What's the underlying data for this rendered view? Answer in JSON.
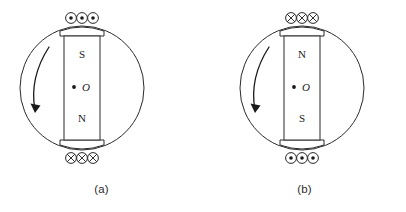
{
  "figure": {
    "panels": [
      {
        "id": "a",
        "caption": "(a)",
        "magnet": {
          "top_pole": "S",
          "bottom_pole": "N",
          "center_label": "O"
        },
        "top_wires": {
          "symbol": "dot",
          "symbol_meaning": "current out of page",
          "count": 3
        },
        "bottom_wires": {
          "symbol": "cross",
          "symbol_meaning": "current into page",
          "count": 3
        },
        "rotation": {
          "direction": "counterclockwise",
          "arrow": "curved-arrow-ccw"
        }
      },
      {
        "id": "b",
        "caption": "(b)",
        "magnet": {
          "top_pole": "N",
          "bottom_pole": "S",
          "center_label": "O"
        },
        "top_wires": {
          "symbol": "cross",
          "symbol_meaning": "current into page",
          "count": 3
        },
        "bottom_wires": {
          "symbol": "dot",
          "symbol_meaning": "current out of page",
          "count": 3
        },
        "rotation": {
          "direction": "counterclockwise",
          "arrow": "curved-arrow-ccw"
        }
      }
    ],
    "colors": {
      "line": "#2a2a2a",
      "ink": "#1a1a1a",
      "background": "#ffffff",
      "caption": "#2b2b2b"
    }
  }
}
